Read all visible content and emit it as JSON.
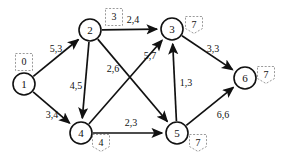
{
  "chart_data": {
    "type": "diagram",
    "title": "",
    "diagram_kind": "directed network flow graph",
    "edge_label_format": "capacity,flow",
    "nodes": [
      {
        "id": "1",
        "label": "1",
        "x": 24,
        "y": 84,
        "r": 11,
        "tag": "0",
        "tag_shape": "box",
        "tag_x": 24,
        "tag_y": 62
      },
      {
        "id": "2",
        "label": "2",
        "x": 90,
        "y": 30,
        "r": 11,
        "tag": "3",
        "tag_shape": "box",
        "tag_x": 114,
        "tag_y": 17
      },
      {
        "id": "3",
        "label": "3",
        "x": 172,
        "y": 29,
        "r": 11,
        "tag": "7",
        "tag_shape": "flag",
        "tag_x": 194,
        "tag_y": 25
      },
      {
        "id": "4",
        "label": "4",
        "x": 81,
        "y": 133,
        "r": 11,
        "tag": "4",
        "tag_shape": "flag",
        "tag_x": 101,
        "tag_y": 143
      },
      {
        "id": "5",
        "label": "5",
        "x": 177,
        "y": 133,
        "r": 11,
        "tag": "7",
        "tag_shape": "flag",
        "tag_x": 198,
        "tag_y": 143
      },
      {
        "id": "6",
        "label": "6",
        "x": 245,
        "y": 78,
        "r": 11,
        "tag": "7",
        "tag_shape": "flag",
        "tag_x": 266,
        "tag_y": 75
      }
    ],
    "edges": [
      {
        "from": "1",
        "to": "2",
        "label": "5,3",
        "capacity": 5,
        "flow": 3,
        "lx": 56,
        "ly": 48
      },
      {
        "from": "1",
        "to": "4",
        "label": "3,4",
        "capacity": 3,
        "flow": 4,
        "lx": 52,
        "ly": 114
      },
      {
        "from": "2",
        "to": "3",
        "label": "2,4",
        "capacity": 2,
        "flow": 4,
        "lx": 133,
        "ly": 19
      },
      {
        "from": "2",
        "to": "4",
        "label": "4,5",
        "capacity": 4,
        "flow": 5,
        "lx": 76,
        "ly": 85
      },
      {
        "from": "2",
        "to": "5",
        "label": "2,6",
        "capacity": 2,
        "flow": 6,
        "lx": 113,
        "ly": 68
      },
      {
        "from": "4",
        "to": "3",
        "label": "5,7",
        "capacity": 5,
        "flow": 7,
        "lx": 150,
        "ly": 55
      },
      {
        "from": "4",
        "to": "5",
        "label": "2,3",
        "capacity": 2,
        "flow": 3,
        "lx": 131,
        "ly": 122
      },
      {
        "from": "5",
        "to": "3",
        "label": "1,3",
        "capacity": 1,
        "flow": 3,
        "lx": 186,
        "ly": 82
      },
      {
        "from": "3",
        "to": "6",
        "label": "3,3",
        "capacity": 3,
        "flow": 3,
        "lx": 213,
        "ly": 48
      },
      {
        "from": "5",
        "to": "6",
        "label": "6,6",
        "capacity": 6,
        "flow": 6,
        "lx": 223,
        "ly": 114
      }
    ]
  },
  "colors": {
    "stroke": "#111111",
    "tag_stroke": "#9a9a9a",
    "background": "#ffffff"
  }
}
